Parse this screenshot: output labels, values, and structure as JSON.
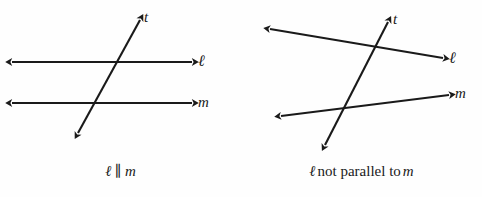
{
  "figure": {
    "background_color": "#fefefe",
    "stroke_color": "#1a1a1a"
  },
  "panels": [
    {
      "id": "parallel",
      "caption": {
        "line_left": "ℓ",
        "relation_symbol": "∥",
        "line_right": "m"
      },
      "labels": {
        "transversal": "t",
        "line_ell": "ℓ",
        "line_m": "m"
      },
      "geometry": {
        "line_ell": {
          "x1": 12,
          "y1": 62,
          "x2": 192,
          "y2": 62
        },
        "line_m": {
          "x1": 12,
          "y1": 103,
          "x2": 192,
          "y2": 103
        },
        "transversal": {
          "x1": 78,
          "y1": 133,
          "x2": 140,
          "y2": 20
        }
      }
    },
    {
      "id": "not-parallel",
      "caption": {
        "line_left": "ℓ",
        "relation_text": "not parallel to",
        "line_right": "m"
      },
      "labels": {
        "transversal": "t",
        "line_ell": "ℓ",
        "line_m": "m"
      },
      "geometry": {
        "line_ell": {
          "x1": 29,
          "y1": 29,
          "x2": 202,
          "y2": 58
        },
        "line_m": {
          "x1": 40,
          "y1": 116,
          "x2": 208,
          "y2": 95
        },
        "transversal": {
          "x1": 84,
          "y1": 145,
          "x2": 147,
          "y2": 22
        }
      }
    }
  ]
}
